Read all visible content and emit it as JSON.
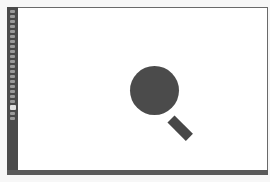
{
  "app": {
    "type": "image-editor"
  },
  "toolbar": {
    "tools": [
      {
        "icon": "move-tool-icon"
      },
      {
        "icon": "marquee-tool-icon"
      },
      {
        "icon": "lasso-tool-icon"
      },
      {
        "icon": "magic-wand-icon"
      },
      {
        "icon": "crop-tool-icon"
      },
      {
        "icon": "eyedropper-icon"
      },
      {
        "icon": "healing-brush-icon"
      },
      {
        "icon": "brush-tool-icon"
      },
      {
        "icon": "clone-stamp-icon"
      },
      {
        "icon": "history-brush-icon"
      },
      {
        "icon": "eraser-icon"
      },
      {
        "icon": "gradient-tool-icon"
      },
      {
        "icon": "blur-tool-icon"
      },
      {
        "icon": "dodge-tool-icon"
      },
      {
        "icon": "pen-tool-icon"
      },
      {
        "icon": "type-tool-icon"
      },
      {
        "icon": "path-selection-icon"
      },
      {
        "icon": "shape-tool-icon"
      },
      {
        "icon": "hand-tool-icon"
      },
      {
        "icon": "zoom-tool-icon",
        "active": true
      },
      {
        "icon": "color-swatches-icon"
      },
      {
        "icon": "quick-mask-icon"
      }
    ]
  },
  "canvas": {
    "background": "#ffffff",
    "artwork": {
      "shape": "magnifying-glass",
      "color": "#4b4b4b"
    }
  },
  "statusbar": {
    "text": ""
  }
}
